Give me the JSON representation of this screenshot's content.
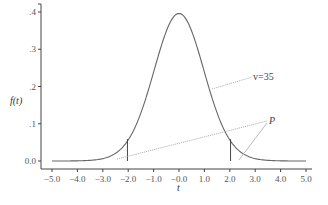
{
  "chart_data": {
    "type": "line",
    "title": "",
    "xlabel": "t",
    "ylabel": "f(t)",
    "xlim": [
      -5.0,
      5.0
    ],
    "ylim": [
      0.0,
      0.4
    ],
    "x_ticks": [
      "-5.0",
      "-4.0",
      "-3.0",
      "-2.0",
      "-1.0",
      "-0.0",
      "1.0",
      "2.0",
      "3.0",
      "4.0",
      "5.0"
    ],
    "y_ticks": [
      "0.0",
      ".1",
      ".2",
      ".3",
      ".4"
    ],
    "grid": false,
    "series": [
      {
        "name": "Student t density, v=35",
        "distribution": "t",
        "degrees_of_freedom": 35,
        "x": [
          -5.0,
          -4.0,
          -3.0,
          -2.5,
          -2.0,
          -1.5,
          -1.0,
          -0.5,
          0.0,
          0.5,
          1.0,
          1.5,
          2.0,
          2.5,
          3.0,
          4.0,
          5.0
        ],
        "values": [
          0.0001,
          0.0009,
          0.0062,
          0.0186,
          0.0555,
          0.1272,
          0.2396,
          0.3478,
          0.3961,
          0.3478,
          0.2396,
          0.1272,
          0.0555,
          0.0186,
          0.0062,
          0.0009,
          0.0001
        ]
      }
    ],
    "critical_values": [
      -2.03,
      2.03
    ],
    "annotations": [
      {
        "text": "v=35",
        "target": "curve"
      },
      {
        "text": "P",
        "target": "both tails beyond critical values"
      }
    ]
  },
  "labels": {
    "y_axis": "f(t)",
    "x_axis": "t",
    "df_label": "v=35",
    "p_label": "P",
    "x_ticks": [
      "-5.0",
      "-4.0",
      "-3.0",
      "-2.0",
      "-1.0",
      "-0.0",
      "1.0",
      "2.0",
      "3.0",
      "4.0",
      "5.0"
    ],
    "y_ticks": [
      "0.0",
      ".1",
      ".2",
      ".3",
      ".4"
    ]
  }
}
